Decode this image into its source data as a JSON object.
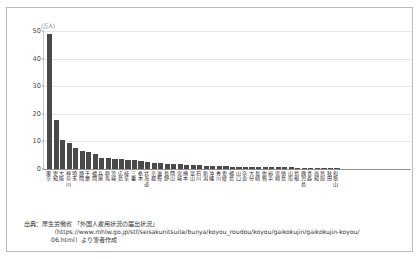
{
  "chart_data": {
    "type": "bar",
    "title": "",
    "xlabel": "",
    "ylabel": "",
    "y_unit_label": "(万人)",
    "ylim": [
      0,
      50
    ],
    "yticks": [
      0,
      10,
      20,
      30,
      40,
      50
    ],
    "grid": true,
    "legend": "none",
    "bar_color": "#4a4a4a",
    "categories": [
      "東京",
      "愛知",
      "大阪",
      "神奈川",
      "埼玉",
      "静岡",
      "千葉",
      "福岡",
      "兵庫",
      "群馬",
      "茨城",
      "広島",
      "岐阜",
      "三重",
      "栃木",
      "北海道",
      "京都",
      "滋賀",
      "長野",
      "岡山",
      "宮城",
      "熊本",
      "富山",
      "石川",
      "新潟",
      "沖縄",
      "香川",
      "愛媛",
      "福島",
      "山口",
      "奈良",
      "大分",
      "長崎",
      "佐賀",
      "岩手",
      "宮崎",
      "徳島",
      "山形",
      "島根",
      "鹿児島",
      "青森",
      "高知",
      "鳥取",
      "秋田",
      "和歌山"
    ],
    "values": [
      48.5,
      17.5,
      10.5,
      9.2,
      7.7,
      6.6,
      6.2,
      5.3,
      4.1,
      3.8,
      3.7,
      3.5,
      3.4,
      3.2,
      2.8,
      2.4,
      2.3,
      2.0,
      1.9,
      1.8,
      1.7,
      1.5,
      1.4,
      1.3,
      1.2,
      1.1,
      1.0,
      0.95,
      0.9,
      0.85,
      0.8,
      0.78,
      0.74,
      0.7,
      0.66,
      0.62,
      0.58,
      0.55,
      0.5,
      0.46,
      0.42,
      0.38,
      0.32,
      0.28,
      0.22
    ]
  },
  "source": {
    "line1": "出典：厚生労働省 「外国人雇用状況の届出状況」",
    "line2": "（https://www.mhlw.go.jp/stf/seisakunitsuite/bunya/koyou_roudou/koyou/gaikokujin/gaikokujin-koyou/",
    "line3": "06.html）より筆者作成"
  }
}
